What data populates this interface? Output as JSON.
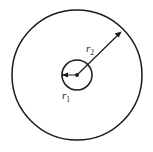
{
  "figure": {
    "background_color": "#ffffff",
    "stroke_color": "#1a1a1a",
    "width": 153,
    "height": 152,
    "center": {
      "x": 77,
      "y": 75
    },
    "labels": {
      "inner_radius": {
        "symbol": "r",
        "subscript": "1",
        "x": 66,
        "y": 97
      },
      "outer_radius": {
        "symbol": "r",
        "subscript": "2",
        "x": 87,
        "y": 54
      }
    },
    "shapes": {
      "outer_circle": {
        "name": "outer-circle",
        "cx": 77,
        "cy": 75,
        "r": 65,
        "stroke_width": 1.5
      },
      "inner_circle": {
        "name": "inner-circle",
        "cx": 77,
        "cy": 75,
        "r": 15,
        "stroke_width": 1.5
      },
      "center_point": {
        "name": "center-dot",
        "cx": 77,
        "cy": 75,
        "r": 1.8
      }
    },
    "arrows": {
      "inner_radius_arrow": {
        "name": "inner-radius-arrow",
        "from_x": 77,
        "from_y": 75,
        "to_x": 63,
        "to_y": 75,
        "direction": "left",
        "double_headed": true
      },
      "outer_radius_arrow": {
        "name": "outer-radius-arrow",
        "from_x": 77,
        "from_y": 75,
        "to_x": 122,
        "to_y": 31,
        "direction": "up-right",
        "angle_degrees": 45,
        "double_headed": false
      }
    }
  }
}
